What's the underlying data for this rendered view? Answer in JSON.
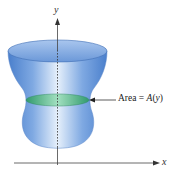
{
  "diagram": {
    "type": "solid-of-cross-sections",
    "y_axis_label": "y",
    "x_axis_label": "x",
    "annotation": {
      "prefix": "Area = ",
      "func": "A",
      "open": "(",
      "var": "y",
      "close": ")"
    },
    "colors": {
      "solid_body": "#5b8fd6",
      "solid_highlight": "#e8f1fb",
      "solid_edge": "#3f6fb5",
      "cross_section": "#3fae78",
      "axis": "#444444",
      "background": "#ffffff"
    }
  }
}
